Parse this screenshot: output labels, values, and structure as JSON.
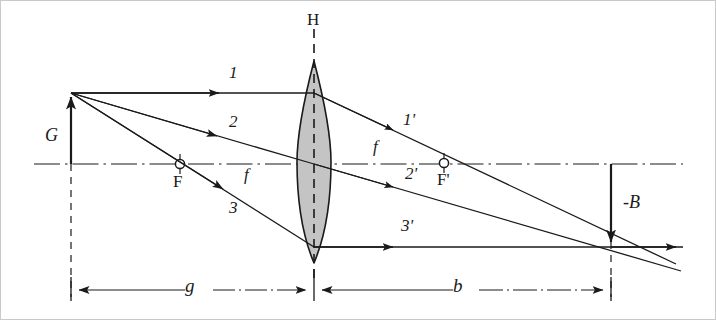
{
  "figure": {
    "background_color": "#ffffff",
    "line_color": "#1a1a1a",
    "lens_fill_color": "#c4c4c4",
    "border_color": "#c9c9c9",
    "width": 716,
    "height": 320
  },
  "labels": {
    "principal_plane": "H",
    "object_height": "G",
    "image_height": "-B",
    "focal_point_object": "F",
    "focal_point_image": "F'",
    "focal_length_left": "f",
    "focal_length_right": "f",
    "object_distance": "g",
    "image_distance": "b",
    "ray_1": "1",
    "ray_2": "2",
    "ray_3": "3",
    "ray_1_prime": "1'",
    "ray_2_prime": "2'",
    "ray_3_prime": "3'"
  },
  "geometry": {
    "optical_axis_y": 163,
    "axis_x_start": 33,
    "axis_x_end": 682,
    "lens_center_x": 313,
    "lens_top_y": 60,
    "lens_bottom_y": 262,
    "lens_half_width": 17,
    "object_x": 70,
    "object_tip_y": 92,
    "focal_left_x": 179,
    "focal_right_x": 443,
    "image_x": 610,
    "image_tip_y": 245,
    "dimension_line_y": 289,
    "ray3_prime_y": 246
  },
  "label_positions": {
    "principal_plane": {
      "x": 306,
      "y": 10,
      "size": 17
    },
    "object_height": {
      "x": 44,
      "y": 125,
      "size": 18
    },
    "image_height": {
      "x": 622,
      "y": 192,
      "size": 18
    },
    "focal_point_object": {
      "x": 172,
      "y": 172,
      "size": 17
    },
    "focal_point_image": {
      "x": 436,
      "y": 170,
      "size": 17
    },
    "focal_length_left": {
      "x": 243,
      "y": 165,
      "size": 17
    },
    "focal_length_right": {
      "x": 372,
      "y": 137,
      "size": 17
    },
    "object_distance": {
      "x": 184,
      "y": 275,
      "size": 19
    },
    "image_distance": {
      "x": 452,
      "y": 275,
      "size": 19
    },
    "ray_1": {
      "x": 228,
      "y": 63,
      "size": 17
    },
    "ray_2": {
      "x": 228,
      "y": 112,
      "size": 17
    },
    "ray_3": {
      "x": 228,
      "y": 198,
      "size": 17
    },
    "ray_1_prime": {
      "x": 402,
      "y": 110,
      "size": 17
    },
    "ray_2_prime": {
      "x": 404,
      "y": 164,
      "size": 17
    },
    "ray_3_prime": {
      "x": 400,
      "y": 216,
      "size": 17
    }
  }
}
